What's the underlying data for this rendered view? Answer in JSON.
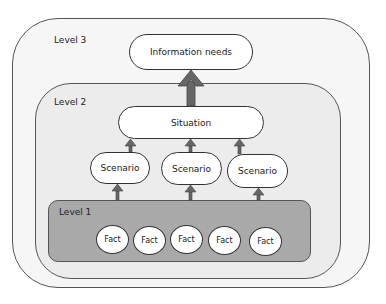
{
  "levels": {
    "level3": {
      "label": "Level 3"
    },
    "level2": {
      "label": "Level 2"
    },
    "level1": {
      "label": "Level 1"
    }
  },
  "nodes": {
    "information_needs": "Information needs",
    "situation": "Situation",
    "scenarios": [
      "Scenario",
      "Scenario",
      "Scenario"
    ],
    "facts": [
      "Fact",
      "Fact",
      "Fact",
      "Fact",
      "Fact"
    ]
  },
  "colors": {
    "level3_fill": "#f6f6f6",
    "level2_fill": "#ececec",
    "level1_fill": "#a9a9a9",
    "arrow": "#666666",
    "node_fill": "#ffffff"
  }
}
